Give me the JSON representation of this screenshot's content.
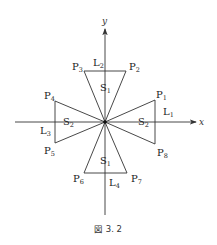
{
  "axes": {
    "x_label": "x",
    "y_label": "y"
  },
  "points": [
    {
      "id": "P1",
      "base": "P",
      "sub": "1"
    },
    {
      "id": "P2",
      "base": "P",
      "sub": "2"
    },
    {
      "id": "P3",
      "base": "P",
      "sub": "3"
    },
    {
      "id": "P4",
      "base": "P",
      "sub": "4"
    },
    {
      "id": "P5",
      "base": "P",
      "sub": "5"
    },
    {
      "id": "P6",
      "base": "P",
      "sub": "6"
    },
    {
      "id": "P7",
      "base": "P",
      "sub": "7"
    },
    {
      "id": "P8",
      "base": "P",
      "sub": "8"
    }
  ],
  "lines": [
    {
      "id": "L1",
      "base": "L",
      "sub": "1"
    },
    {
      "id": "L2",
      "base": "L",
      "sub": "2"
    },
    {
      "id": "L3",
      "base": "L",
      "sub": "3"
    },
    {
      "id": "L4",
      "base": "L",
      "sub": "4"
    }
  ],
  "regions": {
    "top": {
      "base": "S",
      "sub": "1"
    },
    "bottom": {
      "base": "S",
      "sub": "1"
    },
    "left": {
      "base": "S",
      "sub": "2"
    },
    "right": {
      "base": "S",
      "sub": "2"
    }
  },
  "caption": "図 3. 2"
}
